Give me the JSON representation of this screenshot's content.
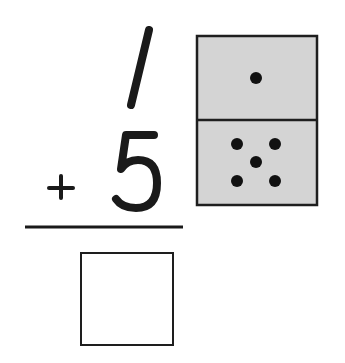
{
  "problem": {
    "addend_top": "1",
    "operator": "+",
    "addend_bottom": "5",
    "answer": "",
    "answer_placeholder": ""
  },
  "domino": {
    "top_dots": 1,
    "bottom_dots": 5,
    "fill_color": "#d4d4d4",
    "border_color": "#1e1e1e",
    "dot_color": "#111111"
  },
  "colors": {
    "ink": "#1a1a1a",
    "background": "#ffffff"
  }
}
